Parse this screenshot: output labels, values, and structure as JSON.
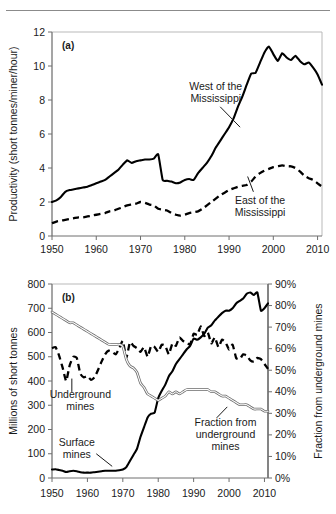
{
  "figure": {
    "background": "#ffffff",
    "rule_color": "#8b8b8b"
  },
  "chart_data": [
    {
      "type": "line",
      "panel_label": "(a)",
      "title": "",
      "xlabel": "",
      "ylabel": "Productivity (short tonnes/miner/hour)",
      "xlim": [
        1950,
        2011
      ],
      "ylim": [
        0,
        12
      ],
      "xticks": [
        1950,
        1960,
        1970,
        1980,
        1990,
        2000,
        2010
      ],
      "yticks": [
        0,
        2,
        4,
        6,
        8,
        10,
        12
      ],
      "xtick_labels": [
        "1950",
        "1960",
        "1970",
        "1980",
        "1990",
        "2000",
        "2010"
      ],
      "ytick_labels": [
        "0",
        "2",
        "4",
        "6",
        "8",
        "10",
        "12"
      ],
      "grid": false,
      "legend": "annotations",
      "annotations": [
        {
          "text": "West of the Mississippi",
          "lines": [
            "West of the",
            "Mississippi"
          ],
          "x": 1987,
          "y": 8.6
        },
        {
          "text": "East of the Mississippi",
          "lines": [
            "East of the",
            "Mississippi"
          ],
          "x": 1997,
          "y": 1.9
        }
      ],
      "series": [
        {
          "name": "West of the Mississippi",
          "style": "solid",
          "x": [
            1950,
            1951,
            1952,
            1953,
            1954,
            1955,
            1956,
            1957,
            1958,
            1959,
            1960,
            1961,
            1962,
            1963,
            1964,
            1965,
            1966,
            1967,
            1968,
            1969,
            1970,
            1971,
            1972,
            1973,
            1974,
            1975,
            1976,
            1977,
            1978,
            1979,
            1980,
            1981,
            1982,
            1983,
            1984,
            1985,
            1986,
            1987,
            1988,
            1989,
            1990,
            1991,
            1992,
            1993,
            1994,
            1995,
            1996,
            1997,
            1998,
            1999,
            2000,
            2001,
            2002,
            2003,
            2004,
            2005,
            2006,
            2007,
            2008,
            2009,
            2010,
            2011
          ],
          "values": [
            2.0,
            2.1,
            2.3,
            2.6,
            2.7,
            2.75,
            2.8,
            2.85,
            2.9,
            3.0,
            3.1,
            3.2,
            3.3,
            3.5,
            3.7,
            3.9,
            4.2,
            4.45,
            4.3,
            4.4,
            4.45,
            4.5,
            4.5,
            4.55,
            4.8,
            3.3,
            3.25,
            3.2,
            3.1,
            3.15,
            3.3,
            3.35,
            3.3,
            3.7,
            4.0,
            4.3,
            4.7,
            5.2,
            5.6,
            6.0,
            6.4,
            6.9,
            7.6,
            8.2,
            8.9,
            9.55,
            9.6,
            10.2,
            10.8,
            11.15,
            10.7,
            10.3,
            10.75,
            10.5,
            10.35,
            10.6,
            10.3,
            10.1,
            10.2,
            9.9,
            9.5,
            8.9
          ]
        },
        {
          "name": "East of the Mississippi",
          "style": "dashed",
          "x": [
            1950,
            1951,
            1952,
            1953,
            1954,
            1955,
            1956,
            1957,
            1958,
            1959,
            1960,
            1961,
            1962,
            1963,
            1964,
            1965,
            1966,
            1967,
            1968,
            1969,
            1970,
            1971,
            1972,
            1973,
            1974,
            1975,
            1976,
            1977,
            1978,
            1979,
            1980,
            1981,
            1982,
            1983,
            1984,
            1985,
            1986,
            1987,
            1988,
            1989,
            1990,
            1991,
            1992,
            1993,
            1994,
            1995,
            1996,
            1997,
            1998,
            1999,
            2000,
            2001,
            2002,
            2003,
            2004,
            2005,
            2006,
            2007,
            2008,
            2009,
            2010,
            2011
          ],
          "values": [
            0.75,
            0.85,
            0.9,
            0.95,
            1.0,
            1.05,
            1.1,
            1.1,
            1.15,
            1.2,
            1.25,
            1.3,
            1.35,
            1.45,
            1.5,
            1.6,
            1.7,
            1.8,
            1.85,
            1.9,
            2.0,
            1.95,
            1.85,
            1.8,
            1.6,
            1.55,
            1.5,
            1.35,
            1.25,
            1.2,
            1.25,
            1.35,
            1.4,
            1.45,
            1.6,
            1.8,
            2.0,
            2.2,
            2.4,
            2.55,
            2.7,
            2.8,
            2.9,
            2.95,
            3.0,
            3.2,
            3.5,
            3.7,
            3.85,
            3.95,
            4.05,
            4.1,
            4.15,
            4.1,
            4.1,
            4.0,
            3.8,
            3.55,
            3.4,
            3.3,
            3.1,
            2.9
          ]
        }
      ]
    },
    {
      "type": "line",
      "panel_label": "(b)",
      "title": "",
      "xlabel": "",
      "ylabel": "Millions of short tonnes",
      "ylabel_right": "Fraction from underground mines",
      "xlim": [
        1950,
        2011
      ],
      "ylim": [
        0,
        800
      ],
      "ylim_right": [
        0,
        90
      ],
      "xticks": [
        1950,
        1960,
        1970,
        1980,
        1990,
        2000,
        2010
      ],
      "yticks": [
        0,
        100,
        200,
        300,
        400,
        500,
        600,
        700,
        800
      ],
      "yticks_right": [
        0,
        10,
        20,
        30,
        40,
        50,
        60,
        70,
        80,
        90
      ],
      "xtick_labels": [
        "1950",
        "1960",
        "1970",
        "1980",
        "1990",
        "2000",
        "2010"
      ],
      "ytick_labels": [
        "0",
        "100",
        "200",
        "300",
        "400",
        "500",
        "600",
        "700",
        "800"
      ],
      "ytick_labels_right": [
        "0%",
        "10%",
        "20%",
        "30%",
        "40%",
        "50%",
        "60%",
        "70%",
        "80%",
        "90%"
      ],
      "grid": false,
      "legend": "annotations",
      "annotations": [
        {
          "text": "Underground mines",
          "lines": [
            "Underground",
            "mines"
          ],
          "x": 1958,
          "y": 330
        },
        {
          "text": "Surface mines",
          "lines": [
            "Surface",
            "mines"
          ],
          "x": 1957,
          "y": 130
        },
        {
          "text": "Fraction from underground mines",
          "lines": [
            "Fraction from",
            "underground",
            "mines"
          ],
          "x": 1999,
          "y": 215
        }
      ],
      "series": [
        {
          "name": "Underground mines",
          "style": "dashed",
          "axis": "left",
          "x": [
            1950,
            1951,
            1952,
            1953,
            1954,
            1955,
            1956,
            1957,
            1958,
            1959,
            1960,
            1961,
            1962,
            1963,
            1964,
            1965,
            1966,
            1967,
            1968,
            1969,
            1970,
            1971,
            1972,
            1973,
            1974,
            1975,
            1976,
            1977,
            1978,
            1979,
            1980,
            1981,
            1982,
            1983,
            1984,
            1985,
            1986,
            1987,
            1988,
            1989,
            1990,
            1991,
            1992,
            1993,
            1994,
            1995,
            1996,
            1997,
            1998,
            1999,
            2000,
            2001,
            2002,
            2003,
            2004,
            2005,
            2006,
            2007,
            2008,
            2009,
            2010,
            2011
          ],
          "values": [
            535,
            540,
            505,
            455,
            400,
            465,
            500,
            495,
            430,
            415,
            420,
            405,
            415,
            445,
            480,
            510,
            525,
            520,
            510,
            535,
            565,
            495,
            560,
            545,
            535,
            520,
            540,
            500,
            545,
            540,
            520,
            550,
            545,
            510,
            555,
            545,
            580,
            565,
            560,
            550,
            595,
            590,
            625,
            585,
            600,
            555,
            580,
            540,
            570,
            560,
            530,
            550,
            495,
            490,
            510,
            505,
            485,
            480,
            495,
            490,
            470,
            450
          ]
        },
        {
          "name": "Surface mines",
          "style": "solid",
          "axis": "left",
          "x": [
            1950,
            1951,
            1952,
            1953,
            1954,
            1955,
            1956,
            1957,
            1958,
            1959,
            1960,
            1961,
            1962,
            1963,
            1964,
            1965,
            1966,
            1967,
            1968,
            1969,
            1970,
            1971,
            1972,
            1973,
            1974,
            1975,
            1976,
            1977,
            1978,
            1979,
            1980,
            1981,
            1982,
            1983,
            1984,
            1985,
            1986,
            1987,
            1988,
            1989,
            1990,
            1991,
            1992,
            1993,
            1994,
            1995,
            1996,
            1997,
            1998,
            1999,
            2000,
            2001,
            2002,
            2003,
            2004,
            2005,
            2006,
            2007,
            2008,
            2009,
            2010,
            2011
          ],
          "values": [
            35,
            36,
            33,
            30,
            25,
            28,
            30,
            28,
            24,
            22,
            22,
            22,
            24,
            26,
            28,
            30,
            30,
            30,
            30,
            32,
            35,
            45,
            70,
            95,
            120,
            170,
            210,
            250,
            265,
            270,
            330,
            360,
            385,
            420,
            440,
            470,
            490,
            510,
            530,
            545,
            575,
            570,
            580,
            595,
            620,
            630,
            650,
            665,
            680,
            690,
            690,
            700,
            720,
            730,
            740,
            760,
            765,
            755,
            765,
            690,
            700,
            720
          ]
        },
        {
          "name": "Fraction from underground mines",
          "style": "outline",
          "axis": "right",
          "x": [
            1950,
            1951,
            1952,
            1953,
            1954,
            1955,
            1956,
            1957,
            1958,
            1959,
            1960,
            1961,
            1962,
            1963,
            1964,
            1965,
            1966,
            1967,
            1968,
            1969,
            1970,
            1971,
            1972,
            1973,
            1974,
            1975,
            1976,
            1977,
            1978,
            1979,
            1980,
            1981,
            1982,
            1983,
            1984,
            1985,
            1986,
            1987,
            1988,
            1989,
            1990,
            1991,
            1992,
            1993,
            1994,
            1995,
            1996,
            1997,
            1998,
            1999,
            2000,
            2001,
            2002,
            2003,
            2004,
            2005,
            2006,
            2007,
            2008,
            2009,
            2010,
            2011
          ],
          "values": [
            77,
            76,
            75,
            74,
            73,
            72,
            72,
            71,
            70,
            69,
            68,
            67,
            66,
            65,
            64,
            63,
            62,
            62,
            62,
            62,
            61,
            55,
            52,
            51,
            49,
            44,
            42,
            39,
            38,
            37,
            36,
            37,
            38,
            40,
            39,
            40,
            39,
            40,
            41,
            41,
            41,
            41,
            41,
            41,
            41,
            40,
            40,
            39,
            38,
            38,
            37,
            36,
            35,
            34,
            34,
            34,
            33,
            32,
            32,
            32,
            31,
            31
          ]
        }
      ]
    }
  ]
}
